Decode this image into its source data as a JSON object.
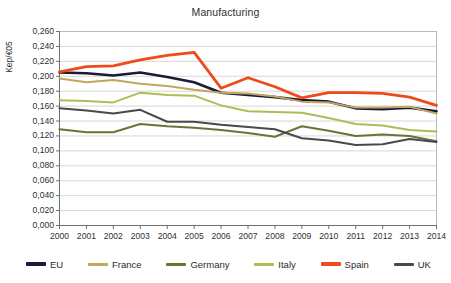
{
  "chart_data": {
    "type": "line",
    "title": "Manufacturing",
    "xlabel": "",
    "ylabel": "Kep/€05",
    "grid": true,
    "legend_position": "bottom",
    "xlim": [
      2000,
      2014
    ],
    "ylim": [
      0.0,
      0.26
    ],
    "categories": [
      "2000",
      "2001",
      "2002",
      "2003",
      "2004",
      "2005",
      "2006",
      "2007",
      "2008",
      "2009",
      "2010",
      "2011",
      "2012",
      "2013",
      "2014"
    ],
    "x": [
      2000,
      2001,
      2002,
      2003,
      2004,
      2005,
      2006,
      2007,
      2008,
      2009,
      2010,
      2011,
      2012,
      2013,
      2014
    ],
    "ytick_labels": [
      "0,000",
      "0,020",
      "0,040",
      "0,060",
      "0,080",
      "0,100",
      "0,120",
      "0,140",
      "0,160",
      "0,180",
      "0,200",
      "0,220",
      "0,240",
      "0,260"
    ],
    "ytick_values": [
      0.0,
      0.02,
      0.04,
      0.06,
      0.08,
      0.1,
      0.12,
      0.14,
      0.16,
      0.18,
      0.2,
      0.22,
      0.24,
      0.26
    ],
    "series": [
      {
        "name": "EU",
        "color": "#1b1b38",
        "width": 2.6,
        "values": [
          0.205,
          0.204,
          0.201,
          0.205,
          0.199,
          0.192,
          0.178,
          0.175,
          0.172,
          0.168,
          0.166,
          0.157,
          0.156,
          0.158,
          0.153
        ]
      },
      {
        "name": "France",
        "color": "#c2a55f",
        "width": 2.0,
        "values": [
          0.197,
          0.192,
          0.195,
          0.19,
          0.187,
          0.182,
          0.178,
          0.177,
          0.173,
          0.166,
          0.165,
          0.158,
          0.158,
          0.159,
          0.15
        ]
      },
      {
        "name": "Germany",
        "color": "#6d7135",
        "width": 2.0,
        "values": [
          0.129,
          0.125,
          0.125,
          0.136,
          0.133,
          0.131,
          0.128,
          0.124,
          0.119,
          0.133,
          0.127,
          0.12,
          0.122,
          0.12,
          0.113
        ]
      },
      {
        "name": "Italy",
        "color": "#aebc56",
        "width": 2.0,
        "values": [
          0.168,
          0.167,
          0.165,
          0.178,
          0.175,
          0.174,
          0.161,
          0.153,
          0.152,
          0.151,
          0.144,
          0.136,
          0.134,
          0.128,
          0.126
        ]
      },
      {
        "name": "Spain",
        "color": "#ef4a1c",
        "width": 2.8,
        "values": [
          0.206,
          0.213,
          0.214,
          0.222,
          0.228,
          0.232,
          0.184,
          0.198,
          0.186,
          0.171,
          0.178,
          0.178,
          0.177,
          0.172,
          0.161
        ]
      },
      {
        "name": "UK",
        "color": "#434b4b",
        "width": 2.0,
        "values": [
          0.157,
          0.154,
          0.15,
          0.155,
          0.139,
          0.139,
          0.135,
          0.132,
          0.129,
          0.117,
          0.114,
          0.108,
          0.109,
          0.116,
          0.112
        ]
      }
    ]
  },
  "legend": {
    "items": [
      {
        "label": "EU"
      },
      {
        "label": "France"
      },
      {
        "label": "Germany"
      },
      {
        "label": "Italy"
      },
      {
        "label": "Spain"
      },
      {
        "label": "UK"
      }
    ]
  }
}
